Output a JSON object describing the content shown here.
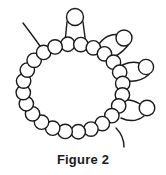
{
  "figure": {
    "caption": "Figure 2",
    "title": "Figure 2",
    "background_color": "#ffffff",
    "stroke_color": "#1a1a1a",
    "bead_fill_color": "#ffffff",
    "stroke_width": 1.4,
    "bead_radius": 7.2,
    "canvas": {
      "width": 166,
      "height": 175,
      "drawing_height": 152
    }
  },
  "chart_data": {
    "type": "diagram",
    "title": "Figure 2",
    "main_ring": {
      "label": "closed bead ring",
      "bead_count": 24,
      "center": {
        "x": 73,
        "y": 88
      },
      "radius_x": 50,
      "radius_y": 44,
      "start_angle_deg": -96
    },
    "loops": [
      {
        "name": "top-stalk-loop",
        "bead": {
          "cx": 75,
          "cy": 17,
          "r": 8.5
        },
        "strands": [
          {
            "x1": 67,
            "y1": 22,
            "x2": 64.5,
            "y2": 47
          },
          {
            "x1": 83,
            "y1": 22,
            "x2": 86,
            "y2": 45
          }
        ]
      },
      {
        "name": "upper-right-branch-loop",
        "bead": {
          "cx": 124,
          "cy": 38,
          "r": 8.0
        },
        "strands": [
          {
            "x1": 116.5,
            "y1": 34.5,
            "cx": 104,
            "cy": 34,
            "x2": 96,
            "y2": 49
          },
          {
            "x1": 128,
            "y1": 45.5,
            "cx": 116,
            "cy": 60,
            "x2": 104,
            "y2": 58
          }
        ]
      },
      {
        "name": "middle-right-branch-loop",
        "bead": {
          "cx": 146,
          "cy": 67,
          "r": 7.6
        },
        "strands": [
          {
            "x1": 139,
            "y1": 63,
            "cx": 127,
            "cy": 60,
            "x2": 115,
            "y2": 70
          },
          {
            "x1": 149,
            "y1": 74.5,
            "cx": 138,
            "cy": 84,
            "x2": 123,
            "y2": 80
          }
        ]
      },
      {
        "name": "lower-right-branch-loop",
        "bead": {
          "cx": 147,
          "cy": 108,
          "r": 7.8
        },
        "strands": [
          {
            "x1": 140,
            "y1": 104,
            "cx": 130,
            "cy": 98,
            "x2": 122,
            "y2": 101
          },
          {
            "x1": 144,
            "y1": 116,
            "cx": 134,
            "cy": 124,
            "x2": 121,
            "y2": 118
          }
        ]
      }
    ],
    "free_ends": [
      {
        "name": "upper-left-tail",
        "path": [
          {
            "x": 40,
            "y": 46
          },
          {
            "x": 30,
            "y": 32
          },
          {
            "x": 23,
            "y": 23
          }
        ]
      },
      {
        "name": "lower-right-tail",
        "path": [
          {
            "x": 116,
            "y": 128
          },
          {
            "x": 124,
            "y": 136
          },
          {
            "x": 124,
            "y": 147
          }
        ]
      }
    ]
  }
}
